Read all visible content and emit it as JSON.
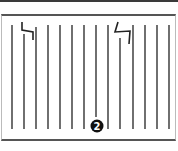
{
  "figure": {
    "callout_label": "2",
    "line_color": "#333333",
    "callout_bg": "#111111",
    "callout_fg": "#ffffff",
    "lines": [
      {
        "x": 12,
        "y1": 25,
        "y2": 129
      },
      {
        "x": 24,
        "y1": 34,
        "y2": 129
      },
      {
        "x": 36,
        "y1": 27,
        "y2": 129
      },
      {
        "x": 48,
        "y1": 25,
        "y2": 129
      },
      {
        "x": 60,
        "y1": 25,
        "y2": 129
      },
      {
        "x": 72,
        "y1": 25,
        "y2": 129
      },
      {
        "x": 84,
        "y1": 25,
        "y2": 129
      },
      {
        "x": 96,
        "y1": 25,
        "y2": 117
      },
      {
        "x": 108,
        "y1": 25,
        "y2": 129
      },
      {
        "x": 120,
        "y1": 38,
        "y2": 129
      },
      {
        "x": 133,
        "y1": 25,
        "y2": 129
      },
      {
        "x": 145,
        "y1": 25,
        "y2": 129
      },
      {
        "x": 157,
        "y1": 25,
        "y2": 129
      },
      {
        "x": 169,
        "y1": 25,
        "y2": 129
      }
    ],
    "break_marks": [
      {
        "points": "22,22 22,30 33,32 33,40"
      },
      {
        "points": "118,22 115,32 130,31 129,44"
      }
    ],
    "callout": {
      "cx": 97,
      "cy": 126,
      "r": 6.5
    }
  }
}
